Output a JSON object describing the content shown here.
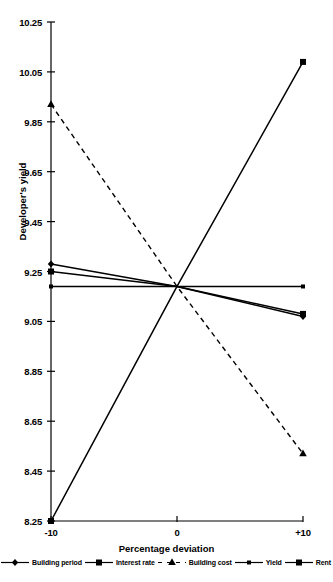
{
  "chart_data": {
    "type": "line",
    "title": "",
    "xlabel": "Percentage deviation",
    "ylabel": "Developer's yield",
    "x": [
      -10,
      0,
      10
    ],
    "xticklabels": [
      "-10",
      "0",
      "+10"
    ],
    "xlim": [
      -10,
      10
    ],
    "ylim": [
      8.25,
      10.25
    ],
    "yticks": [
      8.25,
      8.45,
      8.65,
      8.85,
      9.05,
      9.25,
      9.45,
      9.65,
      9.85,
      10.05,
      10.25
    ],
    "yticklabels": [
      "8.25",
      "8.45",
      "8.65",
      "8.85",
      "9.05",
      "9.25",
      "9.45",
      "9.65",
      "9.85",
      "10.05",
      "10.25"
    ],
    "grid": false,
    "legend_position": "bottom",
    "series": [
      {
        "name": "Building period",
        "values": [
          9.28,
          9.19,
          9.07
        ],
        "marker": "diamond",
        "linestyle": "solid",
        "color": "#000000"
      },
      {
        "name": "Interest rate",
        "values": [
          9.25,
          9.19,
          9.08
        ],
        "marker": "square",
        "linestyle": "solid",
        "color": "#000000"
      },
      {
        "name": "Building cost",
        "values": [
          9.92,
          9.19,
          8.52
        ],
        "marker": "triangle",
        "linestyle": "dashed",
        "color": "#000000"
      },
      {
        "name": "Yield",
        "values": [
          9.19,
          9.19,
          9.19
        ],
        "marker": "small-square",
        "linestyle": "solid",
        "color": "#000000"
      },
      {
        "name": "Rent",
        "values": [
          8.25,
          9.19,
          10.09
        ],
        "marker": "square",
        "linestyle": "solid",
        "color": "#000000"
      }
    ]
  }
}
